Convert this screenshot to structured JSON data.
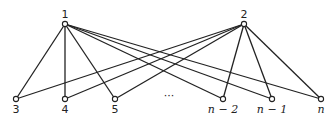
{
  "diagram": {
    "type": "bipartite-graph",
    "top_nodes": [
      {
        "id": "1",
        "label": "1",
        "x": 65,
        "y": 24
      },
      {
        "id": "2",
        "label": "2",
        "x": 244,
        "y": 24
      }
    ],
    "bottom_nodes": [
      {
        "id": "3",
        "label": "3",
        "x": 16,
        "y": 99
      },
      {
        "id": "4",
        "label": "4",
        "x": 65,
        "y": 99
      },
      {
        "id": "5",
        "label": "5",
        "x": 115,
        "y": 99
      },
      {
        "id": "n-2",
        "label": "n − 2",
        "x": 223,
        "y": 99
      },
      {
        "id": "n-1",
        "label": "n − 1",
        "x": 272,
        "y": 99
      },
      {
        "id": "n",
        "label": "n",
        "x": 321,
        "y": 99
      }
    ],
    "ellipsis": "···",
    "edges": [
      [
        "1",
        "3"
      ],
      [
        "1",
        "4"
      ],
      [
        "1",
        "5"
      ],
      [
        "1",
        "n-2"
      ],
      [
        "1",
        "n-1"
      ],
      [
        "1",
        "n"
      ],
      [
        "2",
        "3"
      ],
      [
        "2",
        "4"
      ],
      [
        "2",
        "5"
      ],
      [
        "2",
        "n-2"
      ],
      [
        "2",
        "n-1"
      ],
      [
        "2",
        "n"
      ]
    ]
  }
}
